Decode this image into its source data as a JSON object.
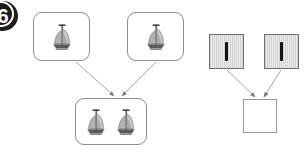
{
  "page": {
    "width": 306,
    "height": 153,
    "background": "#ffffff",
    "kind": "worksheet-diagram"
  },
  "badge": {
    "number": "6",
    "color": "#1c1c1c",
    "text_color": "#ffffff"
  },
  "colors": {
    "card_border": "#8d8d8d",
    "unit_border": "#6f6f6f",
    "unit_fill": "#d2d2d2",
    "bar": "#141414",
    "answer_border": "#9a9a9a",
    "arrow": "#8c8c8c"
  },
  "pictorial_group": {
    "label": "sailboat-combination",
    "addend_one": {
      "icon": "sailboat-icon",
      "count": 1
    },
    "addend_two": {
      "icon": "sailboat-icon",
      "count": 1
    },
    "sum": {
      "icon": "sailboat-icon",
      "count": 2
    }
  },
  "symbolic_group": {
    "label": "unit-bar-combination",
    "addend_one": {
      "icon": "vertical-bar-icon",
      "count": 1
    },
    "addend_two": {
      "icon": "vertical-bar-icon",
      "count": 1
    },
    "sum": {
      "icon": "empty-answer-icon",
      "count": 0,
      "value": ""
    }
  },
  "arrows": [
    {
      "name": "arrow-boat-left-to-sum",
      "from": [
        75,
        61
      ],
      "to": [
        113,
        97
      ]
    },
    {
      "name": "arrow-boat-right-to-sum",
      "from": [
        155,
        61
      ],
      "to": [
        121,
        97
      ]
    },
    {
      "name": "arrow-unit-left-to-sum",
      "from": [
        226,
        69
      ],
      "to": [
        255,
        98
      ]
    },
    {
      "name": "arrow-unit-right-to-sum",
      "from": [
        281,
        69
      ],
      "to": [
        263,
        98
      ]
    }
  ]
}
